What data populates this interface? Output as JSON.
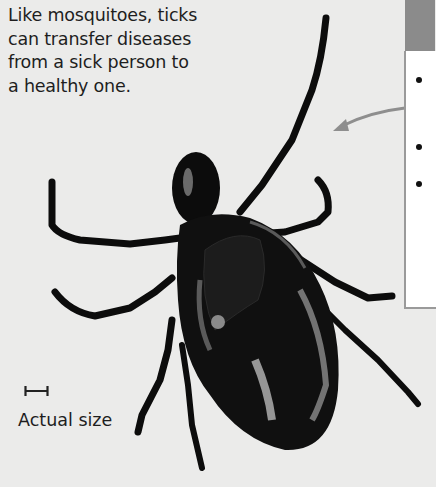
{
  "caption": {
    "lines": [
      "Like mosquitoes, ticks",
      "can transfer diseases",
      "from a sick person to",
      "a healthy one."
    ]
  },
  "sidebar": {
    "header_color": "#8b8b8b",
    "border_color": "#9a9a9a",
    "bullets": 3
  },
  "illustration": {
    "subject": "tick",
    "icon": "tick-illustration"
  },
  "scale": {
    "icon": "scale-bar-icon",
    "label": "Actual size"
  },
  "colors": {
    "background": "#ebebea",
    "text": "#1e1e1e",
    "arrow": "#8e8e8e"
  }
}
